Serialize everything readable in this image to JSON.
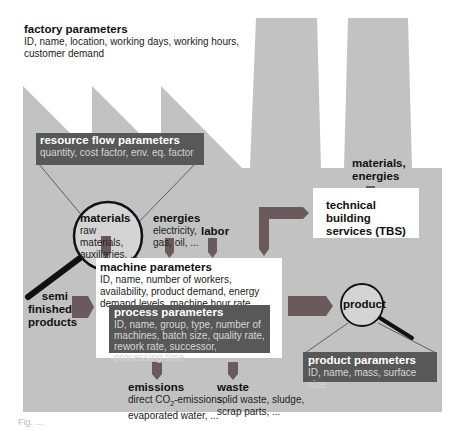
{
  "colors": {
    "factory_fill": "#c0c0c0",
    "dark_box": "#585858",
    "arrow": "#6a5a5c",
    "white_box": "#ffffff"
  },
  "factory": {
    "title": "factory parameters",
    "details": "ID, name, location, working days, working hours, customer demand"
  },
  "resource_flow": {
    "title": "resource flow parameters",
    "details": "quantity, cost factor, env. eq. factor"
  },
  "inputs": {
    "materials": {
      "title": "materials",
      "line1": "raw materials,",
      "line2": "auxiliaries, ..."
    },
    "energies": {
      "title": "energies",
      "line1": "electricity,",
      "line2": "gas, oil, ..."
    },
    "labor": {
      "title": "labor"
    },
    "tbs_inputs": {
      "line1": "materials,",
      "line2": "energies"
    }
  },
  "tbs": {
    "line1": "technical building",
    "line2": "services (TBS)"
  },
  "semi_finished": {
    "line1": "semi",
    "line2": "finished",
    "line3": "products"
  },
  "machine": {
    "title": "machine parameters",
    "details": "ID, name, number of workers, availability, product demand, energy demand levels, machine hour rate"
  },
  "process": {
    "title": "process parameters",
    "details": "ID, name, group, type, number of machines, batch size, quality rate, rework rate, successor, processing time"
  },
  "product": {
    "label": "product",
    "params_title": "product parameters",
    "params_details": "ID, name, mass, surface size"
  },
  "emissions": {
    "title": "emissions",
    "line1_pre": "direct CO",
    "line1_sub": "2",
    "line1_post": "-emissions,",
    "line2": "evaporated water, ..."
  },
  "waste": {
    "title": "waste",
    "line1": "solid waste, sludge,",
    "line2": "scrap parts, ..."
  },
  "caption": "Fig. ..."
}
